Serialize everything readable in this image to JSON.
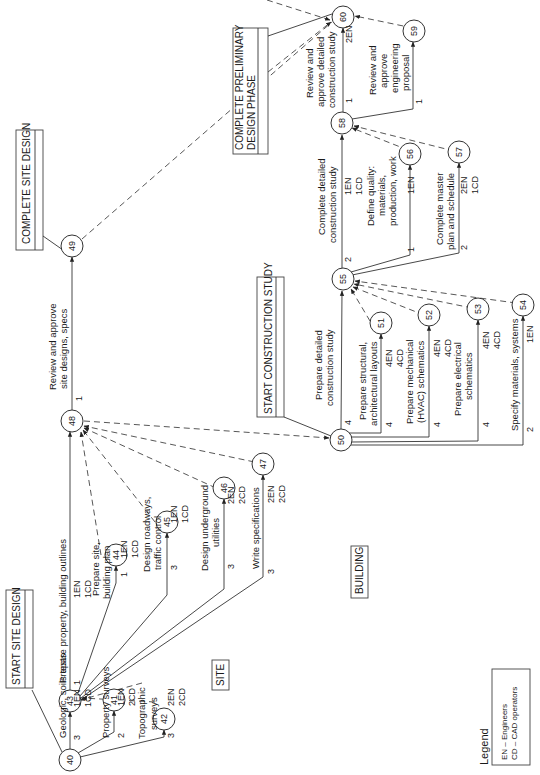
{
  "diagram": {
    "orientation": "rotated-90-ccw",
    "milestones": [
      {
        "id": "start-site-design",
        "label": "START SITE DESIGN"
      },
      {
        "id": "complete-site-design",
        "label": "COMPLETE SITE DESIGN"
      },
      {
        "id": "start-construction-study",
        "label": "START CONSTRUCTION STUDY"
      },
      {
        "id": "complete-preliminary-design-phase",
        "label_line1": "COMPLETE PRELIMINARY",
        "label_line2": "DESIGN PHASE"
      }
    ],
    "section_labels": {
      "site": "SITE",
      "building": "BUILDING"
    },
    "nodes": [
      "40",
      "41",
      "42",
      "43",
      "44",
      "45",
      "46",
      "47",
      "48",
      "49",
      "50",
      "51",
      "52",
      "53",
      "54",
      "55",
      "56",
      "57",
      "58",
      "59",
      "60"
    ],
    "activities": [
      {
        "from": "40",
        "to": "43",
        "lines": [
          "Geologic, soils tests"
        ],
        "duration": "3",
        "resources": [
          "1EN",
          "1CD"
        ]
      },
      {
        "from": "40",
        "to": "41",
        "lines": [
          "Property surveys"
        ],
        "duration": "2",
        "resources": [
          "1EN",
          "2CD"
        ]
      },
      {
        "from": "40",
        "to": "42",
        "lines": [
          "Topographic",
          "surveys"
        ],
        "duration": "3",
        "resources": [
          "2EN",
          "2CD"
        ]
      },
      {
        "from": "43",
        "to": "48",
        "lines": [
          "Prepare property, building outlines"
        ],
        "duration": "1",
        "resources": [
          "1EN",
          "1CD"
        ]
      },
      {
        "from": "43",
        "to": "44",
        "lines": [
          "Prepare site,",
          "building plan"
        ],
        "duration": "1",
        "resources": [
          "1EN",
          "1CD"
        ]
      },
      {
        "from": "43",
        "to": "45",
        "lines": [
          "Design roadways,",
          "traffic control"
        ],
        "duration": "3",
        "resources": [
          "1EN",
          "1CD"
        ]
      },
      {
        "from": "43",
        "to": "46",
        "lines": [
          "Design underground",
          "utilities"
        ],
        "duration": "3",
        "resources": [
          "2EN",
          "2CD"
        ]
      },
      {
        "from": "43",
        "to": "47",
        "lines": [
          "Write specifications"
        ],
        "duration": "3",
        "resources": [
          "2EN",
          "2CD"
        ]
      },
      {
        "from": "48",
        "to": "49",
        "lines": [
          "Review and approve",
          "site designs, specs"
        ],
        "duration": "1",
        "resources": []
      },
      {
        "from": "50",
        "to": "55",
        "lines": [
          "Prepare detailed",
          "construction study"
        ],
        "duration": "4",
        "resources": []
      },
      {
        "from": "50",
        "to": "51",
        "lines": [
          "Prepare structural,",
          "architectural layouts"
        ],
        "duration": "4",
        "resources": [
          "4EN",
          "4CD"
        ]
      },
      {
        "from": "50",
        "to": "52",
        "lines": [
          "Prepare mechanical",
          "(HVAC) schematics"
        ],
        "duration": "4",
        "resources": [
          "4EN",
          "4CD"
        ]
      },
      {
        "from": "50",
        "to": "53",
        "lines": [
          "Prepare electrical",
          "schematics"
        ],
        "duration": "4",
        "resources": [
          "4EN",
          "4CD"
        ]
      },
      {
        "from": "50",
        "to": "54",
        "lines": [
          "Specify materials, systems"
        ],
        "duration": "2",
        "resources": [
          "1EN"
        ]
      },
      {
        "from": "55",
        "to": "58",
        "lines": [
          "Complete detailed",
          "construction study"
        ],
        "duration": "2",
        "resources": [
          "1EN",
          "1CD"
        ]
      },
      {
        "from": "55",
        "to": "56",
        "lines": [
          "Define quality:",
          "materials,",
          "production, work"
        ],
        "duration": "1",
        "resources": [
          "1EN"
        ]
      },
      {
        "from": "55",
        "to": "57",
        "lines": [
          "Complete master",
          "plan and schedule"
        ],
        "duration": "2",
        "resources": [
          "2EN",
          "1CD"
        ]
      },
      {
        "from": "58",
        "to": "60",
        "lines": [
          "Review and",
          "approve detailed",
          "construction study"
        ],
        "duration": "1",
        "resources": [
          "2EN"
        ]
      },
      {
        "from": "58",
        "to": "59",
        "lines": [
          "Review and",
          "approve",
          "engineering",
          "proposal"
        ],
        "duration": "1",
        "resources": []
      }
    ],
    "dummies": [
      [
        "41",
        "43"
      ],
      [
        "42",
        "43"
      ],
      [
        "44",
        "48"
      ],
      [
        "45",
        "48"
      ],
      [
        "46",
        "48"
      ],
      [
        "47",
        "48"
      ],
      [
        "48",
        "50"
      ],
      [
        "49",
        "60"
      ],
      [
        "51",
        "55"
      ],
      [
        "52",
        "55"
      ],
      [
        "53",
        "55"
      ],
      [
        "54",
        "55"
      ],
      [
        "56",
        "58"
      ],
      [
        "57",
        "58"
      ],
      [
        "59",
        "60"
      ]
    ],
    "legend": {
      "title": "Legend",
      "items": [
        "EN – Engineers",
        "CD – CAD operators"
      ]
    }
  }
}
